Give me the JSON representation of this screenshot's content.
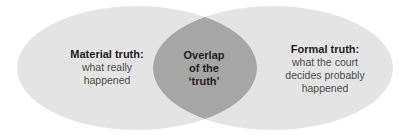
{
  "diagram": {
    "type": "venn",
    "colors": {
      "left_fill": "#e4e4e4",
      "right_fill": "#e4e4e4",
      "overlap_fill": "#a6a6a6"
    },
    "left": {
      "title": "Material truth:",
      "lines": [
        "what really",
        "happened"
      ]
    },
    "overlap": {
      "lines": [
        "Overlap",
        "of the",
        "‘truth’"
      ]
    },
    "right": {
      "title": "Formal truth:",
      "lines": [
        "what the court",
        "decides probably",
        "happened"
      ]
    }
  }
}
